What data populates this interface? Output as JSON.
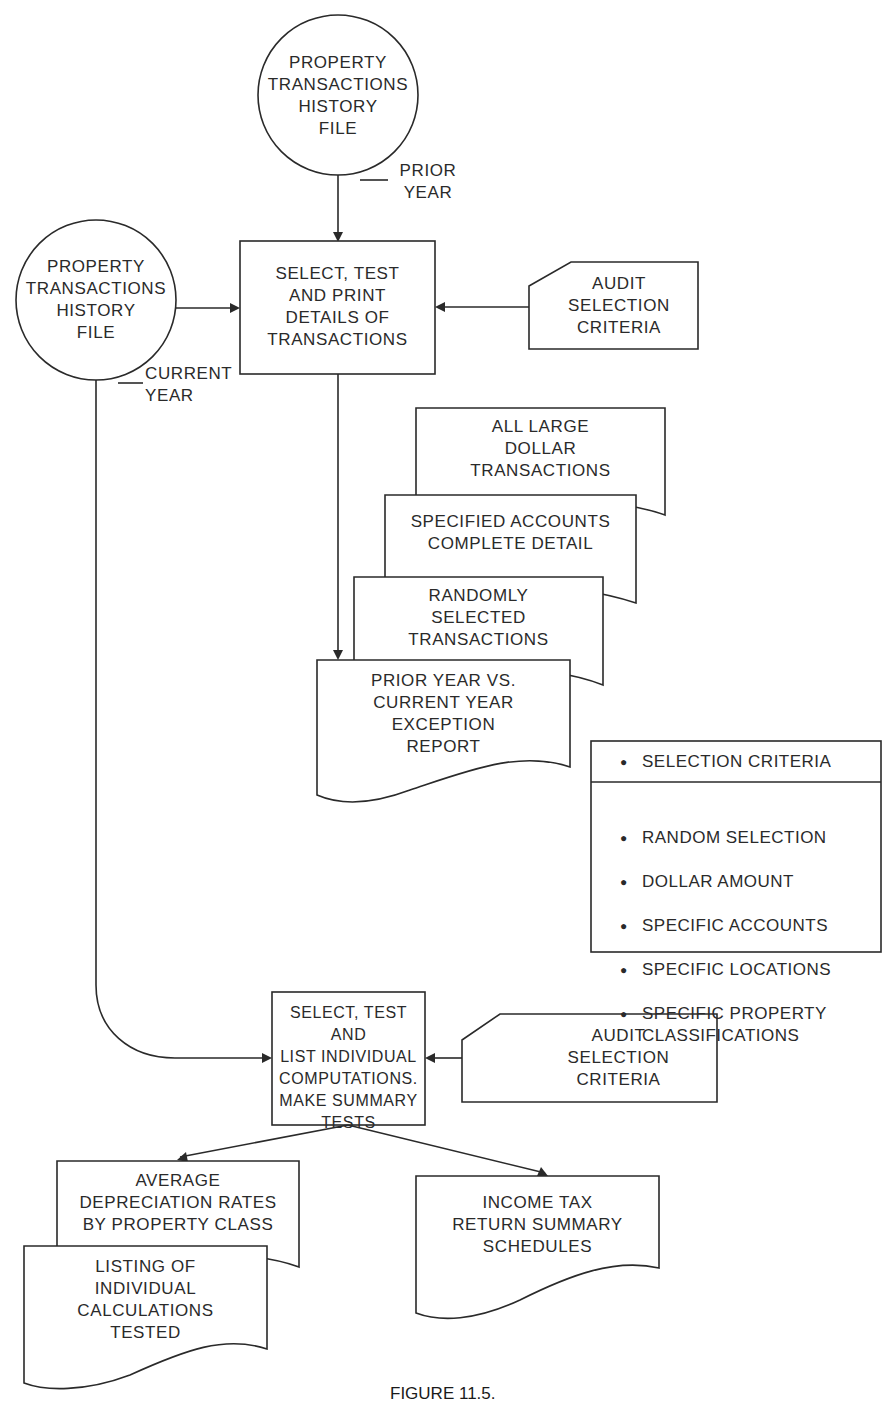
{
  "figure": {
    "caption": "FIGURE 11.5."
  },
  "nodes": {
    "history_prior": {
      "shape": "circle",
      "label": "PROPERTY\nTRANSACTIONS\nHISTORY\nFILE",
      "annotation": "PRIOR\nYEAR"
    },
    "history_current": {
      "shape": "circle",
      "label": "PROPERTY\nTRANSACTIONS\nHISTORY\nFILE",
      "annotation": "CURRENT\nYEAR"
    },
    "process_select_print": {
      "shape": "process",
      "label": "SELECT, TEST\nAND PRINT\nDETAILS OF\nTRANSACTIONS"
    },
    "audit_criteria_1": {
      "shape": "card",
      "label": "AUDIT\nSELECTION\nCRITERIA"
    },
    "report_large_dollar": {
      "shape": "document",
      "label": "ALL LARGE\nDOLLAR\nTRANSACTIONS"
    },
    "report_specified_accounts": {
      "shape": "document",
      "label": "SPECIFIED ACCOUNTS\nCOMPLETE DETAIL"
    },
    "report_random": {
      "shape": "document",
      "label": "RANDOMLY\nSELECTED\nTRANSACTIONS"
    },
    "report_exception": {
      "shape": "document",
      "label": "PRIOR YEAR VS.\nCURRENT YEAR\nEXCEPTION\nREPORT"
    },
    "criteria_legend": {
      "shape": "annotation-box",
      "header": "SELECTION CRITERIA",
      "items": [
        "RANDOM SELECTION",
        "DOLLAR AMOUNT",
        "SPECIFIC ACCOUNTS",
        "SPECIFIC LOCATIONS",
        "SPECIFIC PROPERTY\nCLASSIFICATIONS"
      ]
    },
    "process_computations": {
      "shape": "process",
      "label": "SELECT, TEST AND\nLIST INDIVIDUAL\nCOMPUTATIONS.\nMAKE SUMMARY\nTESTS"
    },
    "audit_criteria_2": {
      "shape": "card",
      "label": "AUDIT\nSELECTION\nCRITERIA"
    },
    "report_depreciation": {
      "shape": "document",
      "label": "AVERAGE\nDEPRECIATION RATES\nBY PROPERTY CLASS"
    },
    "report_calculations": {
      "shape": "document",
      "label": "LISTING OF\nINDIVIDUAL\nCALCULATIONS\nTESTED"
    },
    "report_income_tax": {
      "shape": "document",
      "label": "INCOME TAX\nRETURN SUMMARY\nSCHEDULES"
    }
  },
  "edges": [
    {
      "from": "history_prior",
      "to": "process_select_print"
    },
    {
      "from": "history_current",
      "to": "process_select_print"
    },
    {
      "from": "audit_criteria_1",
      "to": "process_select_print"
    },
    {
      "from": "process_select_print",
      "to": "report_exception"
    },
    {
      "from": "history_current",
      "to": "process_computations"
    },
    {
      "from": "audit_criteria_2",
      "to": "process_computations"
    },
    {
      "from": "process_computations",
      "to": "report_depreciation"
    },
    {
      "from": "process_computations",
      "to": "report_income_tax"
    }
  ]
}
